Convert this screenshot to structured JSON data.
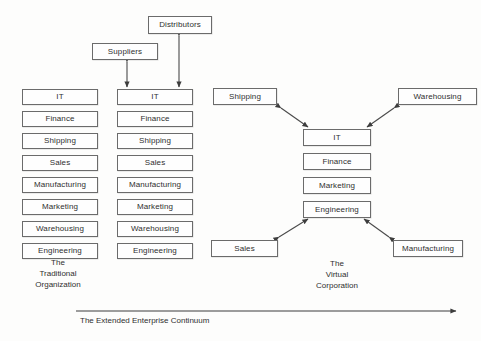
{
  "diagram": {
    "title": "The Extended Enterprise Continuum",
    "background_color": "#fdfdfc",
    "line_color": "#4a4a4a",
    "box_border_color": "#6b6b6b",
    "text_color": "#2f2f2f"
  },
  "partners": [
    {
      "label": "Distributors",
      "x": 148,
      "y": 16,
      "w": 64,
      "h": 18
    },
    {
      "label": "Suppliers",
      "x": 92,
      "y": 43,
      "w": 66,
      "h": 17
    }
  ],
  "traditional": {
    "caption": "The\nTraditional\nOrganization",
    "caption_x": 13,
    "caption_y": 257,
    "caption_w": 90,
    "column_left": {
      "x": 22,
      "y": 89,
      "w": 76,
      "h": 16,
      "gap": 22,
      "departments": [
        "IT",
        "Finance",
        "Shipping",
        "Sales",
        "Manufacturing",
        "Marketing",
        "Warehousing",
        "Engineering"
      ]
    },
    "column_right": {
      "x": 117,
      "y": 89,
      "w": 76,
      "h": 16,
      "gap": 22,
      "departments": [
        "IT",
        "Finance",
        "Shipping",
        "Sales",
        "Manufacturing",
        "Marketing",
        "Warehousing",
        "Engineering"
      ]
    }
  },
  "virtual": {
    "caption": "The\nVirtual\nCorporation",
    "caption_x": 295,
    "caption_y": 258,
    "caption_w": 84,
    "core": {
      "x": 303,
      "y": 129,
      "w": 68,
      "h": 17,
      "gap": 24,
      "departments": [
        "IT",
        "Finance",
        "Marketing",
        "Engineering"
      ]
    },
    "satellites": [
      {
        "label": "Shipping",
        "x": 213,
        "y": 88,
        "w": 64,
        "h": 17
      },
      {
        "label": "Warehousing",
        "x": 398,
        "y": 88,
        "w": 79,
        "h": 17
      },
      {
        "label": "Sales",
        "x": 211,
        "y": 240,
        "w": 67,
        "h": 17
      },
      {
        "label": "Manufacturing",
        "x": 393,
        "y": 240,
        "w": 70,
        "h": 17
      }
    ]
  },
  "continuum": {
    "label": "The Extended Enterprise Continuum",
    "label_x": 80,
    "label_y": 316,
    "arrow_from_x": 76,
    "arrow_to_x": 456,
    "arrow_y": 311
  }
}
